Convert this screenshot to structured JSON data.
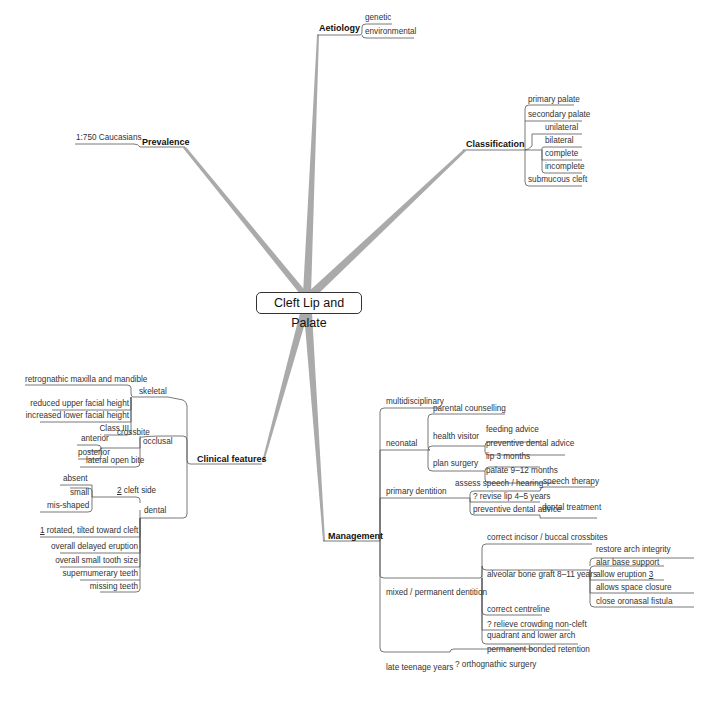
{
  "root": {
    "label": "Cleft Lip and Palate"
  },
  "branches": {
    "aetiology": {
      "label": "Aetiology",
      "children": [
        "genetic",
        "environmental"
      ]
    },
    "classification": {
      "label": "Classification",
      "children": [
        "primary palate",
        "secondary palate",
        "unilateral",
        "bilateral",
        "complete",
        "incomplete",
        "submucous cleft"
      ]
    },
    "prevalence": {
      "label": "Prevalence",
      "children": [
        "1:750 Caucasians"
      ]
    },
    "clinical_features": {
      "label": "Clinical features",
      "skeletal": {
        "label": "skeletal",
        "children": [
          "retrognathic maxilla and mandible",
          "reduced upper facial height",
          "increased lower facial height",
          "Class III"
        ]
      },
      "occlusal": {
        "label": "occlusal",
        "crossbite": {
          "label": "crossbite",
          "children": [
            "anterior",
            "posterior"
          ]
        },
        "lateral_open_bite": "lateral open bite"
      },
      "dental": {
        "label": "dental",
        "cleft_side": {
          "num": "2",
          "label": " cleft side",
          "children": [
            "absent",
            "small",
            "mis-shaped"
          ]
        },
        "rotated_num": "1",
        "rotated": " rotated, tilted toward cleft",
        "others": [
          "overall delayed eruption",
          "overall small tooth size",
          "supernumerary teeth",
          "missing teeth"
        ]
      }
    },
    "management": {
      "label": "Management",
      "multidisciplinary": "multidisciplinary",
      "neonatal": {
        "label": "neonatal",
        "parental": "parental counselling",
        "health_visitor": {
          "label": "health visitor",
          "children": [
            "feeding advice",
            "preventive dental advice"
          ]
        },
        "plan_surgery": {
          "label": "plan surgery",
          "children": [
            "lip 3 months",
            "palate 9–12 months"
          ]
        }
      },
      "primary_dentition": {
        "label": "primary dentition",
        "assess": "assess speech / hearing",
        "speech_therapy": "speech therapy",
        "revise": "? revise lip 4–5 years",
        "preventive": "preventive dental advice",
        "dental_treatment": "dental treatment"
      },
      "mixed": {
        "label": "mixed / permanent dentition",
        "crossbites": "correct incisor / buccal crossbites",
        "graft": {
          "label": "alveolar bone graft 8–11 years",
          "children": [
            "restore arch integrity",
            "alar base support",
            "allow eruption ",
            "allows space closure",
            "close oronasal fistula"
          ],
          "eruption_num": "3"
        },
        "centreline": "correct centreline",
        "crowding_1": "? relieve crowding non-cleft",
        "crowding_2": "quadrant and lower arch",
        "retention": "permanent bonded retention"
      },
      "late_teen": {
        "label": "late teenage years",
        "children": [
          "? orthognathic surgery"
        ]
      }
    }
  }
}
